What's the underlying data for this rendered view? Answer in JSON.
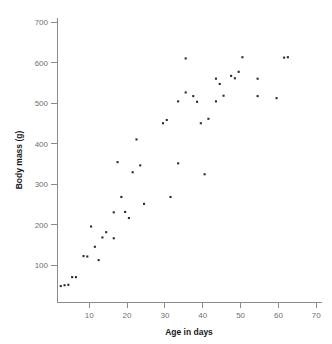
{
  "figure": {
    "top_caption": "",
    "background_color": "#ffffff",
    "point_color": "#2b2b30",
    "axis_color": "#8a8a90"
  },
  "chart_data": {
    "type": "scatter",
    "title": "",
    "xlabel": "Age in days",
    "ylabel": "Body mass (g)",
    "xlim": [
      0,
      70
    ],
    "ylim": [
      0,
      700
    ],
    "xticks": [
      10,
      20,
      30,
      40,
      50,
      60,
      70
    ],
    "yticks": [
      100,
      200,
      300,
      400,
      500,
      600,
      700
    ],
    "grid": false,
    "legend": null,
    "marker": "square",
    "series": [
      {
        "name": "Body mass vs age",
        "points": [
          [
            1,
            48
          ],
          [
            2,
            50
          ],
          [
            3,
            51
          ],
          [
            4,
            70
          ],
          [
            5,
            70
          ],
          [
            7,
            122
          ],
          [
            8,
            121
          ],
          [
            9,
            195
          ],
          [
            10,
            145
          ],
          [
            11,
            112
          ],
          [
            12,
            168
          ],
          [
            13,
            181
          ],
          [
            15,
            166
          ],
          [
            15,
            230
          ],
          [
            16,
            354
          ],
          [
            17,
            268
          ],
          [
            18,
            231
          ],
          [
            19,
            216
          ],
          [
            20,
            329
          ],
          [
            21,
            410
          ],
          [
            22,
            346
          ],
          [
            23,
            251
          ],
          [
            28,
            450
          ],
          [
            29,
            458
          ],
          [
            30,
            268
          ],
          [
            32,
            351
          ],
          [
            32,
            504
          ],
          [
            34,
            610
          ],
          [
            34,
            526
          ],
          [
            36,
            517
          ],
          [
            37,
            503
          ],
          [
            38,
            450
          ],
          [
            39,
            324
          ],
          [
            40,
            461
          ],
          [
            42,
            504
          ],
          [
            42,
            560
          ],
          [
            43,
            547
          ],
          [
            44,
            518
          ],
          [
            46,
            567
          ],
          [
            47,
            561
          ],
          [
            48,
            577
          ],
          [
            49,
            613
          ],
          [
            53,
            560
          ],
          [
            53,
            517
          ],
          [
            58,
            512
          ],
          [
            60,
            612
          ],
          [
            61,
            613
          ]
        ]
      }
    ]
  }
}
